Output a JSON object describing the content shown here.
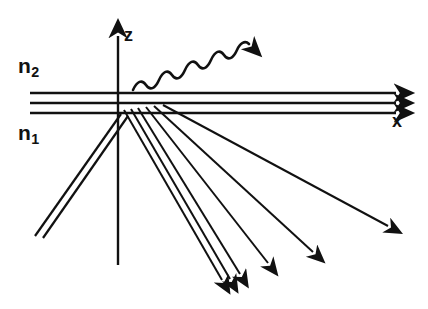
{
  "figure": {
    "background_color": "#ffffff",
    "ink_color": "#111111",
    "width": 428,
    "height": 309
  },
  "axes": {
    "z_axis": {
      "label": "z",
      "direction": "up",
      "origin_x": 118,
      "tip_y": 32,
      "bottom_y": 265
    },
    "x_axis": {
      "label": "x",
      "direction": "right",
      "origin_y": 113,
      "tip_x": 408
    }
  },
  "media": {
    "upper": {
      "label_base": "n",
      "label_sub": "2",
      "position": "above interface"
    },
    "lower": {
      "label_base": "n",
      "label_sub": "1",
      "position": "below interface"
    }
  },
  "interface": {
    "description": "three horizontal boundary lines forming the layer",
    "line_y_values": [
      93,
      103,
      113
    ],
    "x_start": 30,
    "x_end": 404,
    "arrow_heads": 3
  },
  "incident_beam": {
    "name": "incident-double-ray",
    "ray_count": 2,
    "from": [
      35,
      232
    ],
    "to": [
      120,
      112
    ],
    "has_arrowhead": false
  },
  "scattered_rays": [
    {
      "name": "ray-1",
      "from": [
        124,
        110
      ],
      "to": [
        226,
        287
      ],
      "arrowhead": true
    },
    {
      "name": "ray-2",
      "from": [
        131,
        109
      ],
      "to": [
        234,
        286
      ],
      "arrowhead": true
    },
    {
      "name": "ray-3",
      "from": [
        137,
        108
      ],
      "to": [
        244,
        281
      ],
      "arrowhead": true
    },
    {
      "name": "ray-4",
      "from": [
        143,
        107
      ],
      "to": [
        272,
        270
      ],
      "arrowhead": true
    },
    {
      "name": "ray-5",
      "from": [
        149,
        106
      ],
      "to": [
        317,
        259
      ],
      "arrowhead": true
    },
    {
      "name": "ray-6",
      "from": [
        157,
        105
      ],
      "to": [
        393,
        232
      ],
      "arrowhead": true
    }
  ],
  "transmitted_rays": {
    "description": "rays continuing to the right along the interface",
    "count": 3
  },
  "emitted_wave": {
    "name": "wavy-photon-arrow",
    "description": "sinusoidal wave leaving the interface toward upper right",
    "start": [
      133,
      88
    ],
    "end": [
      266,
      22
    ],
    "wavelength_px": 26,
    "amplitude_px": 9,
    "has_arrowhead": true
  }
}
